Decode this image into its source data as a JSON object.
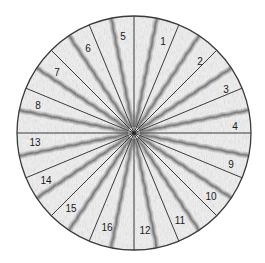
{
  "diagram": {
    "type": "segmented-circle",
    "center": [
      134,
      133
    ],
    "radius": 117,
    "sector_count": 16,
    "sector_angle_deg": 22.5,
    "colors": {
      "background": "#ffffff",
      "outline": "#3a3a3a",
      "texture_light": "#f2f2f2",
      "texture_dark": "#7a7a7a"
    },
    "sectors": [
      {
        "label": "1",
        "start_deg": 0,
        "label_pos": [
          163,
          42
        ]
      },
      {
        "label": "2",
        "start_deg": 22.5,
        "label_pos": [
          200,
          62
        ]
      },
      {
        "label": "3",
        "start_deg": 45,
        "label_pos": [
          226,
          90
        ]
      },
      {
        "label": "4",
        "start_deg": 67.5,
        "label_pos": [
          235,
          127
        ]
      },
      {
        "label": "9",
        "start_deg": 90,
        "label_pos": [
          231,
          165
        ]
      },
      {
        "label": "10",
        "start_deg": 112.5,
        "label_pos": [
          211,
          197
        ]
      },
      {
        "label": "11",
        "start_deg": 135,
        "label_pos": [
          180,
          221
        ]
      },
      {
        "label": "12",
        "start_deg": 157.5,
        "label_pos": [
          145,
          231
        ]
      },
      {
        "label": "16",
        "start_deg": 180,
        "label_pos": [
          107,
          228
        ]
      },
      {
        "label": "15",
        "start_deg": 202.5,
        "label_pos": [
          71,
          209
        ]
      },
      {
        "label": "14",
        "start_deg": 225,
        "label_pos": [
          46,
          181
        ]
      },
      {
        "label": "13",
        "start_deg": 247.5,
        "label_pos": [
          35,
          143
        ]
      },
      {
        "label": "8",
        "start_deg": 270,
        "label_pos": [
          38,
          106
        ]
      },
      {
        "label": "7",
        "start_deg": 292.5,
        "label_pos": [
          57,
          73
        ]
      },
      {
        "label": "6",
        "start_deg": 315,
        "label_pos": [
          88,
          49
        ]
      },
      {
        "label": "5",
        "start_deg": 337.5,
        "label_pos": [
          123,
          37
        ]
      }
    ]
  }
}
